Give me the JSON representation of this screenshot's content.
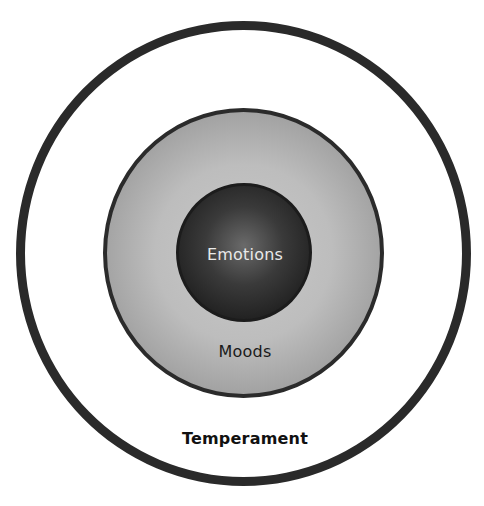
{
  "diagram": {
    "type": "concentric-circles",
    "layers": [
      {
        "id": "temperament",
        "label": "Temperament",
        "position": "outer",
        "fill": "#ffffff",
        "border": "#2a2a2a"
      },
      {
        "id": "moods",
        "label": "Moods",
        "position": "middle",
        "fill": "#b0b0b0",
        "border": "#2b2b2b"
      },
      {
        "id": "emotions",
        "label": "Emotions",
        "position": "inner",
        "fill": "#2a2a2a",
        "border": "#1c1c1c",
        "text_color": "#e9e9e9"
      }
    ]
  }
}
